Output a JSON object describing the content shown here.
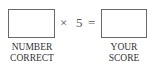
{
  "equation": {
    "times_symbol": "×",
    "multiplier": "5",
    "equals_symbol": "="
  },
  "left_box": {
    "label_line1": "NUMBER",
    "label_line2": "CORRECT",
    "value": ""
  },
  "right_box": {
    "label_line1": "YOUR",
    "label_line2": "SCORE",
    "value": ""
  }
}
